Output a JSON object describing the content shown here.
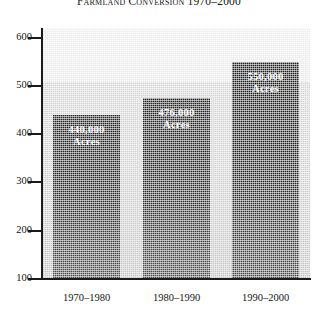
{
  "chart_data": {
    "type": "bar",
    "title": "Farmland Conversion 1970–2000",
    "xlabel": "",
    "ylabel": "",
    "categories": [
      "1970–1980",
      "1980–1990",
      "1990–2000"
    ],
    "values": [
      440000,
      550000,
      476000
    ],
    "series": [
      {
        "name": "Acres converted",
        "values": [
          440000,
          476000,
          550000
        ]
      }
    ],
    "data_labels": [
      {
        "value": "440,000",
        "unit": "Acres"
      },
      {
        "value": "476,000",
        "unit": "Acres"
      },
      {
        "value": "550,000",
        "unit": "Acres"
      }
    ],
    "yticks": [
      100,
      200,
      300,
      400,
      500,
      600
    ],
    "ytick_labels": [
      "100",
      "200",
      "300",
      "400",
      "500",
      "600"
    ],
    "ylim": [
      100,
      620
    ],
    "y_units_note": "thousands of acres",
    "grid": false,
    "legend": "none",
    "colors": {
      "bar_top": "#1b1b1b",
      "bar_bottom": "#464646",
      "plot_background_upper": "#ededed",
      "plot_background_lower": "#cfcfcf",
      "axis": "#1a1a1a",
      "label_text": "#ffffff",
      "tick_text": "#141414",
      "page_background": "#ffffff"
    }
  },
  "axis": {
    "y": {
      "ticks": [
        {
          "label": "600"
        },
        {
          "label": "500"
        },
        {
          "label": "400"
        },
        {
          "label": "300"
        },
        {
          "label": "200"
        },
        {
          "label": "100"
        }
      ]
    },
    "x": {
      "ticks": [
        {
          "label": "1970–1980"
        },
        {
          "label": "1980–1990"
        },
        {
          "label": "1990–2000"
        }
      ]
    }
  },
  "bars": [
    {
      "category": "1970–1980",
      "value": 440000,
      "label_value": "440,000",
      "label_unit": "Acres"
    },
    {
      "category": "1980–1990",
      "value": 476000,
      "label_value": "476,000",
      "label_unit": "Acres"
    },
    {
      "category": "1990–2000",
      "value": 550000,
      "label_value": "550,000",
      "label_unit": "Acres"
    }
  ]
}
